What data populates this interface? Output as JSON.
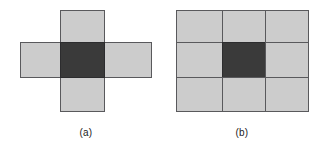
{
  "figure": {
    "background_color": "#ffffff",
    "cell_fill_color": "#cccccc",
    "center_fill_color": "#3a3a3a",
    "border_color": "#59595c",
    "panels": [
      {
        "id": "a",
        "caption": "(a)",
        "shape": "plus-cross",
        "description": "4-neighbourhood",
        "cells": [
          {
            "name": "top",
            "shade": "light"
          },
          {
            "name": "left",
            "shade": "light"
          },
          {
            "name": "center",
            "shade": "dark"
          },
          {
            "name": "right",
            "shade": "light"
          },
          {
            "name": "bottom",
            "shade": "light"
          }
        ]
      },
      {
        "id": "b",
        "caption": "(b)",
        "shape": "3x3-grid",
        "description": "8-neighbourhood",
        "rows": 3,
        "columns": 3,
        "cells": [
          {
            "name": "top-left",
            "shade": "light"
          },
          {
            "name": "top-center",
            "shade": "light"
          },
          {
            "name": "top-right",
            "shade": "light"
          },
          {
            "name": "middle-left",
            "shade": "light"
          },
          {
            "name": "center",
            "shade": "dark"
          },
          {
            "name": "middle-right",
            "shade": "light"
          },
          {
            "name": "bottom-left",
            "shade": "light"
          },
          {
            "name": "bottom-center",
            "shade": "light"
          },
          {
            "name": "bottom-right",
            "shade": "light"
          }
        ]
      }
    ]
  }
}
